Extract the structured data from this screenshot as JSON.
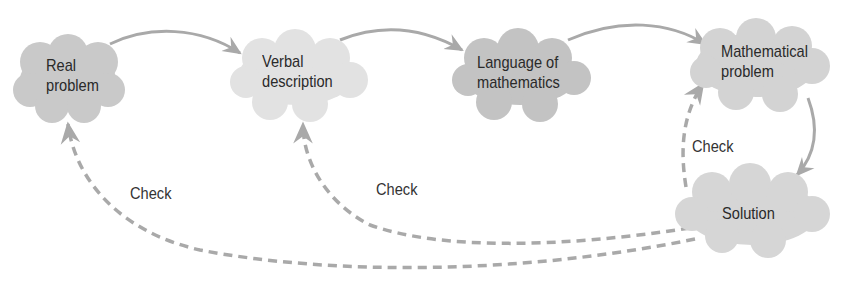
{
  "diagram": {
    "type": "flow",
    "nodes": [
      {
        "id": "real",
        "line1": "Real",
        "line2": "problem",
        "fill": "#c9c9c9"
      },
      {
        "id": "verbal",
        "line1": "Verbal",
        "line2": "description",
        "fill": "#e2e2e2"
      },
      {
        "id": "language",
        "line1": "Language of",
        "line2": "mathematics",
        "fill": "#c3c3c3"
      },
      {
        "id": "math",
        "line1": "Mathematical",
        "line2": "problem",
        "fill": "#d3d3d3"
      },
      {
        "id": "solution",
        "line1": "Solution",
        "fill": "#d6d6d6"
      }
    ],
    "edges": [
      {
        "from": "real",
        "to": "verbal",
        "style": "solid"
      },
      {
        "from": "verbal",
        "to": "language",
        "style": "solid"
      },
      {
        "from": "language",
        "to": "math",
        "style": "solid"
      },
      {
        "from": "math",
        "to": "solution",
        "style": "solid"
      },
      {
        "from": "solution",
        "to": "math",
        "style": "dashed",
        "label": "Check"
      },
      {
        "from": "solution",
        "to": "verbal",
        "style": "dashed",
        "label": "Check"
      },
      {
        "from": "solution",
        "to": "real",
        "style": "dashed",
        "label": "Check"
      }
    ],
    "colors": {
      "arrow": "#a9a9a9",
      "text": "#2a2a2a"
    }
  }
}
